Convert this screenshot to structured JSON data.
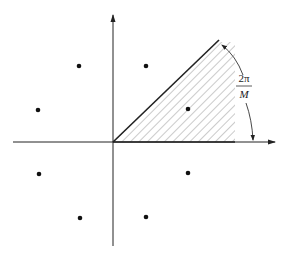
{
  "diagram": {
    "title": "",
    "angle_label_numerator": "2π",
    "angle_label_denominator": "M",
    "origin": [
      113,
      142
    ],
    "x_axis": {
      "from": 13,
      "to": 275,
      "y": 142
    },
    "y_axis": {
      "from": 246,
      "to": 15,
      "x": 113
    },
    "constellation_points": [
      [
        79,
        66
      ],
      [
        146,
        66
      ],
      [
        38,
        110
      ],
      [
        188,
        109
      ],
      [
        39,
        174
      ],
      [
        188,
        173
      ],
      [
        80,
        218
      ],
      [
        146,
        217
      ]
    ],
    "decision_region": {
      "description": "hatched wedge between x-axis and line at angle 2π/M",
      "vertices": [
        [
          113,
          142
        ],
        [
          219,
          41
        ],
        [
          235,
          41
        ],
        [
          235,
          142
        ]
      ]
    },
    "colors": {
      "line": "#222222",
      "hatch": "#888888",
      "point": "#111111"
    }
  }
}
